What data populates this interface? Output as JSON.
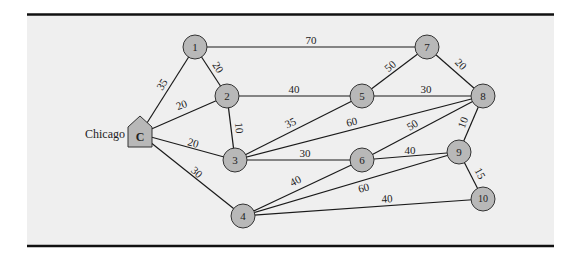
{
  "diagram": {
    "source_label": "Chicago",
    "colors": {
      "background": "#efefef",
      "frame_line": "#111111",
      "edge": "#1a1a1a",
      "node_fill": "#b8b8b8",
      "node_stroke": "#333333",
      "text": "#222222"
    },
    "nodes": [
      {
        "id": "C",
        "label": "C",
        "shape": "house",
        "x": 140,
        "y": 134
      },
      {
        "id": "1",
        "label": "1",
        "shape": "circle",
        "x": 195,
        "y": 47
      },
      {
        "id": "2",
        "label": "2",
        "shape": "circle",
        "x": 227,
        "y": 96
      },
      {
        "id": "3",
        "label": "3",
        "shape": "circle",
        "x": 235,
        "y": 160
      },
      {
        "id": "4",
        "label": "4",
        "shape": "circle",
        "x": 243,
        "y": 216
      },
      {
        "id": "5",
        "label": "5",
        "shape": "circle",
        "x": 362,
        "y": 96
      },
      {
        "id": "6",
        "label": "6",
        "shape": "circle",
        "x": 362,
        "y": 160
      },
      {
        "id": "7",
        "label": "7",
        "shape": "circle",
        "x": 427,
        "y": 47
      },
      {
        "id": "8",
        "label": "8",
        "shape": "circle",
        "x": 483,
        "y": 96
      },
      {
        "id": "9",
        "label": "9",
        "shape": "circle",
        "x": 459,
        "y": 152
      },
      {
        "id": "10",
        "label": "10",
        "shape": "circle",
        "x": 483,
        "y": 199
      }
    ],
    "edges": [
      {
        "from": "C",
        "to": "1",
        "weight": "35",
        "lx": 163,
        "ly": 85,
        "rot": -57
      },
      {
        "from": "C",
        "to": "2",
        "weight": "20",
        "lx": 182,
        "ly": 106,
        "rot": -20
      },
      {
        "from": "C",
        "to": "3",
        "weight": "20",
        "lx": 193,
        "ly": 144,
        "rot": 15
      },
      {
        "from": "C",
        "to": "4",
        "weight": "30",
        "lx": 196,
        "ly": 173,
        "rot": 42
      },
      {
        "from": "1",
        "to": "2",
        "weight": "20",
        "lx": 217,
        "ly": 68,
        "rot": 58
      },
      {
        "from": "1",
        "to": "7",
        "weight": "70",
        "lx": 311,
        "ly": 41,
        "rot": 0
      },
      {
        "from": "2",
        "to": "5",
        "weight": "40",
        "lx": 294,
        "ly": 90,
        "rot": 0
      },
      {
        "from": "2",
        "to": "3",
        "weight": "10",
        "lx": 238,
        "ly": 128,
        "rot": 85
      },
      {
        "from": "3",
        "to": "5",
        "weight": "35",
        "lx": 291,
        "ly": 124,
        "rot": -25
      },
      {
        "from": "3",
        "to": "8",
        "weight": "60",
        "lx": 352,
        "ly": 123,
        "rot": -13
      },
      {
        "from": "3",
        "to": "6",
        "weight": "30",
        "lx": 305,
        "ly": 154,
        "rot": 0
      },
      {
        "from": "4",
        "to": "6",
        "weight": "40",
        "lx": 296,
        "ly": 182,
        "rot": -28
      },
      {
        "from": "4",
        "to": "9",
        "weight": "60",
        "lx": 364,
        "ly": 189,
        "rot": -14
      },
      {
        "from": "4",
        "to": "10",
        "weight": "40",
        "lx": 387,
        "ly": 200,
        "rot": -3
      },
      {
        "from": "5",
        "to": "7",
        "weight": "50",
        "lx": 391,
        "ly": 67,
        "rot": -42
      },
      {
        "from": "5",
        "to": "8",
        "weight": "30",
        "lx": 426,
        "ly": 90,
        "rot": 0
      },
      {
        "from": "7",
        "to": "8",
        "weight": "20",
        "lx": 460,
        "ly": 65,
        "rot": 45
      },
      {
        "from": "6",
        "to": "8",
        "weight": "50",
        "lx": 413,
        "ly": 126,
        "rot": -32
      },
      {
        "from": "6",
        "to": "9",
        "weight": "40",
        "lx": 410,
        "ly": 151,
        "rot": 0
      },
      {
        "from": "8",
        "to": "9",
        "weight": "10",
        "lx": 464,
        "ly": 123,
        "rot": -70
      },
      {
        "from": "9",
        "to": "10",
        "weight": "15",
        "lx": 479,
        "ly": 174,
        "rot": 62
      }
    ]
  }
}
